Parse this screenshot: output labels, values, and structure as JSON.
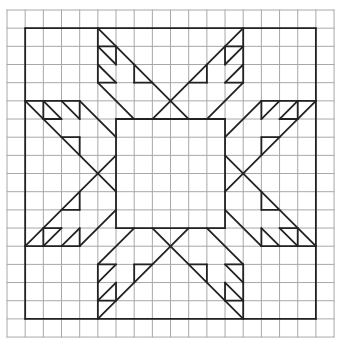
{
  "diagram": {
    "grid": {
      "cells_x": 18,
      "cells_y": 18,
      "origin_x": 7,
      "origin_y": 10,
      "cell_size": 18.17,
      "line_color": "#a8a8a8"
    },
    "pattern": {
      "line_color": "#222222",
      "outer_square": [
        1,
        1,
        17,
        17
      ],
      "center_square": [
        6,
        6,
        12,
        12
      ]
    },
    "colors": {
      "background": "#ffffff",
      "grid": "#a8a8a8",
      "ink": "#222222"
    }
  }
}
